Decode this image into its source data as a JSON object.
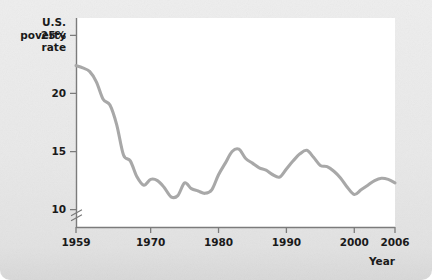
{
  "chart_data": {
    "type": "line",
    "title": "",
    "ylabel_lines": [
      "U.S.",
      "poverty",
      "rate"
    ],
    "xlabel": "Year",
    "ylabel": "U.S. poverty rate",
    "grid": false,
    "legend": null,
    "axis_break": true,
    "xlim": [
      1959,
      2006
    ],
    "ylim": [
      8.5,
      26.5
    ],
    "xticks": [
      1959,
      1970,
      1980,
      1990,
      2000,
      2006
    ],
    "xtick_labels": [
      "1959",
      "1970",
      "1980",
      "1990",
      "2000",
      "2006"
    ],
    "yticks": [
      10,
      15,
      20,
      25
    ],
    "ytick_labels": [
      "10",
      "15",
      "20",
      "25%"
    ],
    "series": [
      {
        "name": "U.S. poverty rate",
        "color": "#a8a8a8",
        "x": [
          1959,
          1960,
          1961,
          1962,
          1963,
          1964,
          1965,
          1966,
          1967,
          1968,
          1969,
          1970,
          1971,
          1972,
          1973,
          1974,
          1975,
          1976,
          1977,
          1978,
          1979,
          1980,
          1981,
          1982,
          1983,
          1984,
          1985,
          1986,
          1987,
          1988,
          1989,
          1990,
          1991,
          1992,
          1993,
          1994,
          1995,
          1996,
          1997,
          1998,
          1999,
          2000,
          2001,
          2002,
          2003,
          2004,
          2005,
          2006
        ],
        "values": [
          22.4,
          22.2,
          21.9,
          21.0,
          19.5,
          19.0,
          17.3,
          14.7,
          14.2,
          12.8,
          12.1,
          12.6,
          12.5,
          11.9,
          11.1,
          11.2,
          12.3,
          11.8,
          11.6,
          11.4,
          11.7,
          13.0,
          14.0,
          15.0,
          15.2,
          14.4,
          14.0,
          13.6,
          13.4,
          13.0,
          12.8,
          13.5,
          14.2,
          14.8,
          15.1,
          14.5,
          13.8,
          13.7,
          13.3,
          12.7,
          11.9,
          11.3,
          11.7,
          12.1,
          12.5,
          12.7,
          12.6,
          12.3
        ]
      }
    ]
  },
  "figure": {
    "background_color": "#e9e9e9",
    "plot_background_color": "#ffffff",
    "axis_color": "#7b7b7b",
    "line_color": "#a8a8a8"
  }
}
